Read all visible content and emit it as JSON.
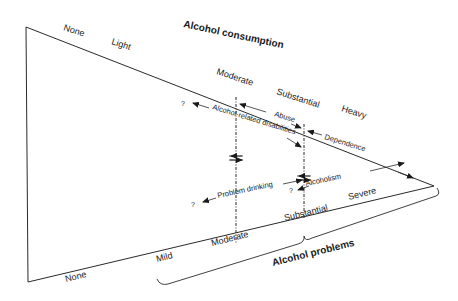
{
  "diagram": {
    "consumption_axis": {
      "title": "Alcohol consumption",
      "levels": [
        "None",
        "Light",
        "Moderate",
        "Substantial",
        "Heavy"
      ]
    },
    "problems_axis": {
      "title": "Alcohol problems",
      "levels": [
        "None",
        "Mild",
        "Moderate",
        "Substantial",
        "Severe"
      ]
    },
    "relations": {
      "alcohol_related_disabilities": "Alcohol-related disabilities",
      "abuse": "Abuse",
      "dependence": "Dependence",
      "problem_drinking": "Problem drinking",
      "alcoholism": "Alcoholism"
    },
    "unknown_marker": "?"
  }
}
